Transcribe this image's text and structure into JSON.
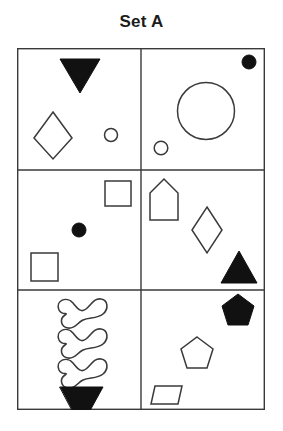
{
  "figure": {
    "title": "Set A",
    "type": "shape-matrix",
    "columns": 2,
    "rows": 3,
    "stroke_color": "#3a3a3a",
    "fill_color": "#111111",
    "background_color": "#ffffff",
    "frame": {
      "x": 17,
      "y": 48,
      "width": 248,
      "height": 362
    }
  },
  "cells": [
    {
      "id": "cell-top-left",
      "row": 1,
      "column": 1,
      "shapes": [
        {
          "name": "triangle-down-filled",
          "shape": "triangle-down",
          "fill": "solid",
          "size": "large"
        },
        {
          "name": "diamond-outline",
          "shape": "diamond",
          "fill": "outline",
          "size": "large"
        },
        {
          "name": "circle-outline-small",
          "shape": "circle",
          "fill": "outline",
          "size": "small"
        }
      ]
    },
    {
      "id": "cell-top-right",
      "row": 1,
      "column": 2,
      "shapes": [
        {
          "name": "circle-filled-small",
          "shape": "circle",
          "fill": "solid",
          "size": "small"
        },
        {
          "name": "circle-outline-large",
          "shape": "circle",
          "fill": "outline",
          "size": "large"
        },
        {
          "name": "circle-outline-small",
          "shape": "circle",
          "fill": "outline",
          "size": "small"
        }
      ]
    },
    {
      "id": "cell-middle-left",
      "row": 2,
      "column": 1,
      "shapes": [
        {
          "name": "square-outline-upper",
          "shape": "square",
          "fill": "outline",
          "size": "medium"
        },
        {
          "name": "circle-filled-small",
          "shape": "circle",
          "fill": "solid",
          "size": "small"
        },
        {
          "name": "square-outline-lower",
          "shape": "square",
          "fill": "outline",
          "size": "medium"
        }
      ]
    },
    {
      "id": "cell-middle-right",
      "row": 2,
      "column": 2,
      "shapes": [
        {
          "name": "house-outline",
          "shape": "house",
          "fill": "outline",
          "size": "medium"
        },
        {
          "name": "diamond-outline",
          "shape": "diamond",
          "fill": "outline",
          "size": "medium"
        },
        {
          "name": "triangle-up-filled",
          "shape": "triangle-up",
          "fill": "solid",
          "size": "medium"
        }
      ]
    },
    {
      "id": "cell-bottom-left",
      "row": 3,
      "column": 1,
      "shapes": [
        {
          "name": "squiggle-outline-1",
          "shape": "squiggle",
          "fill": "outline",
          "size": "medium"
        },
        {
          "name": "squiggle-outline-2",
          "shape": "squiggle",
          "fill": "outline",
          "size": "medium"
        },
        {
          "name": "squiggle-outline-3",
          "shape": "squiggle",
          "fill": "outline",
          "size": "medium"
        },
        {
          "name": "triangle-down-filled",
          "shape": "triangle-down",
          "fill": "solid",
          "size": "medium"
        }
      ]
    },
    {
      "id": "cell-bottom-right",
      "row": 3,
      "column": 2,
      "shapes": [
        {
          "name": "pentagon-filled",
          "shape": "pentagon",
          "fill": "solid",
          "size": "medium"
        },
        {
          "name": "pentagon-outline",
          "shape": "pentagon",
          "fill": "outline",
          "size": "medium"
        },
        {
          "name": "trapezoid-outline",
          "shape": "trapezoid",
          "fill": "outline",
          "size": "small"
        }
      ]
    }
  ]
}
